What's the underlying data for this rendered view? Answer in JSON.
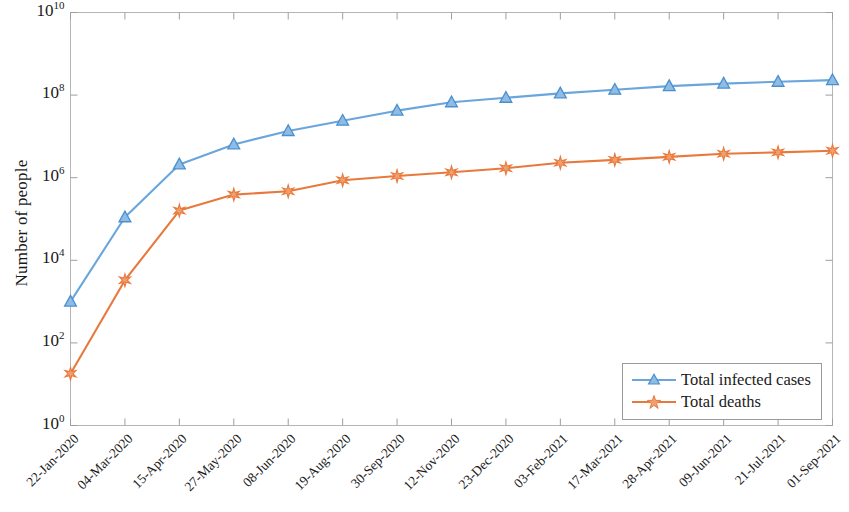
{
  "chart_data": {
    "type": "line",
    "title": "",
    "xlabel": "",
    "ylabel": "Number of people",
    "yscale": "log",
    "ylim": [
      1,
      10000000000
    ],
    "ytick_labels": [
      "10^10",
      "10^8",
      "10^6",
      "10^4",
      "10^2",
      "10^0"
    ],
    "ytick_values": [
      10000000000,
      100000000,
      1000000,
      10000,
      100,
      1
    ],
    "grid": false,
    "legend_position": "lower right",
    "categories": [
      "22-Jan-2020",
      "04-Mar-2020",
      "15-Apr-2020",
      "27-May-2020",
      "08-Jun-2020",
      "19-Aug-2020",
      "30-Sep-2020",
      "12-Nov-2020",
      "23-Dec-2020",
      "03-Feb-2021",
      "17-Mar-2021",
      "28-Apr-2021",
      "09-Jun-2021",
      "21-Jul-2021",
      "01-Sep-2021"
    ],
    "series": [
      {
        "name": "Total infected cases",
        "color": "#6AA5DC",
        "marker": "triangle",
        "values": [
          1000,
          110000,
          2100000,
          6400000,
          13500000,
          24000000,
          42000000,
          67000000,
          86000000,
          110000000,
          135000000,
          165000000,
          190000000,
          210000000,
          230000000
        ]
      },
      {
        "name": "Total deaths",
        "color": "#E8793C",
        "marker": "star",
        "values": [
          18,
          3300,
          160000,
          390000,
          470000,
          870000,
          1100000,
          1350000,
          1700000,
          2300000,
          2700000,
          3200000,
          3800000,
          4100000,
          4500000
        ]
      }
    ]
  },
  "legend": {
    "entries": [
      {
        "label": "Total infected cases"
      },
      {
        "label": "Total deaths"
      }
    ]
  },
  "axes": {
    "y_label": "Number of people"
  }
}
